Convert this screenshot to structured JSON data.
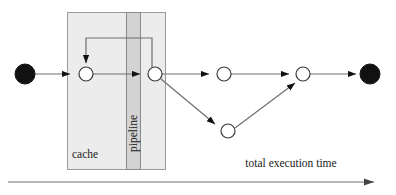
{
  "diagram": {
    "title": "total execution time",
    "labels": {
      "cache": "cache",
      "pipeline": "pipeline",
      "axis": "total execution time"
    },
    "colors": {
      "background": "#ffffff",
      "node_fill_terminal": "#111111",
      "node_fill_stage": "#ffffff",
      "node_stroke": "#3b3b3b",
      "edge": "#6e6e6e",
      "arrowhead": "#111111",
      "cache_box_fill": "#ececed",
      "cache_box_stroke": "#9a9a9a",
      "pipeline_strip_fill": "#d3d3d3",
      "pipeline_strip_stroke": "#8a8a8a",
      "axis_line": "#6e6e6e",
      "text": "#1a1a1a"
    },
    "regions": [
      {
        "name": "cache",
        "x": 67,
        "y": 12,
        "width": 99,
        "height": 158,
        "label": "cache"
      },
      {
        "name": "pipeline",
        "x": 126,
        "y": 12,
        "width": 15,
        "height": 158,
        "label": "pipeline"
      }
    ],
    "nodes": [
      {
        "id": "start",
        "type": "terminal",
        "x": 25,
        "y": 74,
        "r": 10
      },
      {
        "id": "s1",
        "type": "stage",
        "x": 86,
        "y": 74,
        "r": 7
      },
      {
        "id": "s2",
        "type": "stage",
        "x": 155,
        "y": 74,
        "r": 7
      },
      {
        "id": "s3",
        "type": "stage",
        "x": 224,
        "y": 74,
        "r": 7
      },
      {
        "id": "s4",
        "type": "stage",
        "x": 228,
        "y": 131,
        "r": 7
      },
      {
        "id": "s5",
        "type": "stage",
        "x": 303,
        "y": 74,
        "r": 7
      },
      {
        "id": "end",
        "type": "terminal",
        "x": 370,
        "y": 74,
        "r": 10
      }
    ],
    "edges": [
      {
        "from": "start",
        "to": "s1",
        "kind": "straight"
      },
      {
        "from": "s1",
        "to": "s2",
        "kind": "straight"
      },
      {
        "from": "s2",
        "to": "s3",
        "kind": "straight"
      },
      {
        "from": "s2",
        "to": "s4",
        "kind": "straight"
      },
      {
        "from": "s3",
        "to": "s5",
        "kind": "straight"
      },
      {
        "from": "s4",
        "to": "s5",
        "kind": "straight"
      },
      {
        "from": "s5",
        "to": "end",
        "kind": "straight"
      },
      {
        "from": "s2",
        "to": "s1",
        "kind": "feedback-loop"
      }
    ],
    "axis": {
      "x1": 8,
      "y1": 182,
      "x2": 375,
      "y2": 182,
      "label": "total execution time",
      "label_x": 291,
      "label_y": 167
    }
  }
}
